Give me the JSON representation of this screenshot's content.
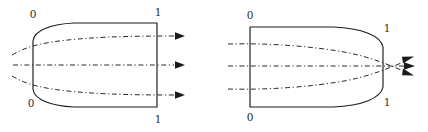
{
  "figure": {
    "background_color": "#ffffff",
    "stroke_color": "#1a1a1a",
    "dash_color": "#2b2b2b",
    "width": 428,
    "height": 132
  },
  "panels": [
    {
      "id": "left-panel",
      "name": "left-domain",
      "description": "Domain with curved (convex-left) inlet boundary and straight vertical outlet boundary; three dash-dot streamlines diverge left-to-right and exit as arrows.",
      "labels": [
        {
          "name": "label-inlet-top",
          "text": "0",
          "x": 33,
          "y": 15
        },
        {
          "name": "label-outlet-top",
          "text": "1",
          "x": 158,
          "y": 13
        },
        {
          "name": "label-inlet-bottom",
          "text": "0",
          "x": 31,
          "y": 104
        },
        {
          "name": "label-outlet-bottom",
          "text": "1",
          "x": 158,
          "y": 120
        }
      ],
      "boundary_path": "M 33 89 L 33 41 C 34 30 52 24 74 23 L 157 23 L 157 107 L 74 107 C 52 106 34 100 33 89 Z",
      "streamlines": [
        {
          "name": "streamline-upper",
          "path": "M 12 55 C 24 48 34 45 52 42 C 86 37 126 36 174 36"
        },
        {
          "name": "streamline-center",
          "path": "M 13 65 L 174 65"
        },
        {
          "name": "streamline-lower",
          "path": "M 12 76 C 24 83 34 86 52 89 C 86 94 126 95 174 95"
        }
      ],
      "arrows": [
        {
          "name": "arrow-upper",
          "tip_x": 184,
          "tip_y": 36,
          "angle": 0
        },
        {
          "name": "arrow-center",
          "tip_x": 184,
          "tip_y": 65,
          "angle": 0
        },
        {
          "name": "arrow-lower",
          "tip_x": 184,
          "tip_y": 95,
          "angle": 0
        }
      ]
    },
    {
      "id": "right-panel",
      "name": "right-domain",
      "description": "Domain with straight vertical inlet boundary and curved (convex-right) outlet boundary; three dash-dot streamlines converge left-to-right and exit as arrows.",
      "labels": [
        {
          "name": "label-inlet-top",
          "text": "0",
          "x": 250,
          "y": 16
        },
        {
          "name": "label-outlet-top",
          "text": "1",
          "x": 387,
          "y": 29
        },
        {
          "name": "label-inlet-bottom",
          "text": "0",
          "x": 250,
          "y": 118
        },
        {
          "name": "label-outlet-bottom",
          "text": "1",
          "x": 387,
          "y": 103
        }
      ],
      "boundary_path": "M 250 27 L 333 27 C 362 28 381 36 383 47 L 383 87 C 381 98 362 106 333 107 L 250 107 L 250 27 Z",
      "streamlines": [
        {
          "name": "streamline-upper",
          "path": "M 228 44 C 268 43 310 46 344 52 C 366 56 382 62 406 72"
        },
        {
          "name": "streamline-center",
          "path": "M 228 66 L 406 66"
        },
        {
          "name": "streamline-lower",
          "path": "M 228 89 C 268 90 310 87 344 81 C 366 77 382 71 406 61"
        }
      ],
      "arrows": [
        {
          "name": "arrow-upper",
          "tip_x": 412,
          "tip_y": 74,
          "angle": 22
        },
        {
          "name": "arrow-center",
          "tip_x": 414,
          "tip_y": 66,
          "angle": 0
        },
        {
          "name": "arrow-lower",
          "tip_x": 412,
          "tip_y": 59,
          "angle": -22
        }
      ]
    }
  ]
}
